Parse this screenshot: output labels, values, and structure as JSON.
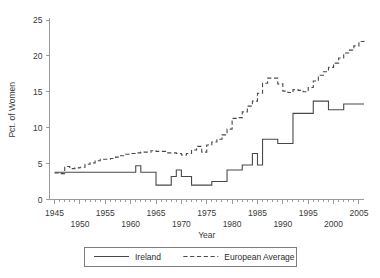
{
  "chart_data": {
    "type": "line",
    "title": "",
    "xlabel": "Year",
    "ylabel": "Pct. of Women",
    "xlim": [
      1944,
      2006
    ],
    "ylim": [
      0,
      25
    ],
    "grid": false,
    "legend_position": "bottom-outside",
    "xticks": [
      1945,
      1950,
      1955,
      1960,
      1965,
      1970,
      1975,
      1980,
      1985,
      1990,
      1995,
      2000,
      2005
    ],
    "xtick_labels": [
      "1945",
      "1950",
      "1955",
      "1960",
      "1965",
      "1970",
      "1975",
      "1980",
      "1985",
      "1990",
      "1995",
      "2000",
      "2005"
    ],
    "xtick_minor_step": 1,
    "yticks": [
      0,
      5,
      10,
      15,
      20,
      25
    ],
    "ytick_labels": [
      "0",
      "5",
      "10",
      "15",
      "20",
      "25"
    ],
    "x": [
      1945,
      1946,
      1947,
      1948,
      1949,
      1950,
      1951,
      1952,
      1953,
      1954,
      1955,
      1956,
      1957,
      1958,
      1959,
      1960,
      1961,
      1962,
      1963,
      1964,
      1965,
      1966,
      1967,
      1968,
      1969,
      1970,
      1971,
      1972,
      1973,
      1974,
      1975,
      1976,
      1977,
      1978,
      1979,
      1980,
      1981,
      1982,
      1983,
      1984,
      1985,
      1986,
      1987,
      1988,
      1989,
      1990,
      1991,
      1992,
      1993,
      1994,
      1995,
      1996,
      1997,
      1998,
      1999,
      2000,
      2001,
      2002,
      2003,
      2004,
      2005,
      2006
    ],
    "series": [
      {
        "name": "Ireland",
        "style": "solid",
        "values": [
          3.8,
          3.8,
          3.8,
          3.8,
          3.8,
          3.8,
          3.8,
          3.8,
          3.8,
          3.8,
          3.8,
          3.8,
          3.8,
          3.8,
          3.8,
          3.8,
          4.7,
          3.8,
          3.8,
          3.8,
          2.0,
          2.0,
          2.0,
          3.2,
          4.1,
          3.2,
          3.2,
          2.0,
          2.0,
          2.0,
          2.0,
          2.5,
          2.5,
          2.5,
          4.1,
          4.1,
          4.1,
          4.8,
          4.8,
          6.4,
          4.8,
          8.4,
          8.4,
          8.4,
          7.8,
          7.8,
          7.8,
          12.0,
          12.0,
          12.0,
          12.0,
          13.7,
          13.7,
          13.7,
          12.5,
          12.5,
          12.5,
          13.3,
          13.3,
          13.3,
          13.3,
          13.3
        ]
      },
      {
        "name": "European Average",
        "style": "dashed",
        "values": [
          3.7,
          3.6,
          4.6,
          4.3,
          4.4,
          4.5,
          4.9,
          5.1,
          5.4,
          5.6,
          5.6,
          5.7,
          5.9,
          6.1,
          6.3,
          6.4,
          6.5,
          6.6,
          6.6,
          6.8,
          6.7,
          6.7,
          6.5,
          6.5,
          6.4,
          6.2,
          6.4,
          6.9,
          7.4,
          6.6,
          7.6,
          8.0,
          8.4,
          9.0,
          9.8,
          11.3,
          11.4,
          12.2,
          13.0,
          13.7,
          14.8,
          16.2,
          16.9,
          16.9,
          16.1,
          15.1,
          14.9,
          15.3,
          15.2,
          15.0,
          15.6,
          16.5,
          17.3,
          17.8,
          18.4,
          19.0,
          19.7,
          20.4,
          20.8,
          21.4,
          22.0,
          22.1
        ]
      }
    ]
  },
  "legend": {
    "entries": [
      {
        "label": "Ireland",
        "style": "solid"
      },
      {
        "label": "European Average",
        "style": "dashed"
      }
    ]
  }
}
